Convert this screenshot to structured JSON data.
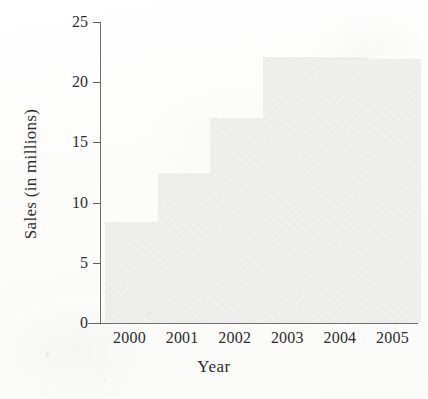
{
  "figure": {
    "background_color": "#fdfdfc",
    "axis_color": "#6f6f6f",
    "bar_color": "#efefee",
    "text_color": "#2c2c2c"
  },
  "chart_data": {
    "type": "bar",
    "title": "",
    "subtitle": "",
    "xlabel": "Year",
    "ylabel": "Sales (in millions)",
    "categories": [
      "2000",
      "2001",
      "2002",
      "2003",
      "2004",
      "2005"
    ],
    "values": [
      8.4,
      12.5,
      17.0,
      22.1,
      22.1,
      21.9
    ],
    "ylim": [
      0,
      25
    ],
    "ytick_labels": [
      "0",
      "5",
      "10",
      "15",
      "20",
      "25"
    ],
    "ytick_values": [
      0,
      5,
      10,
      15,
      20,
      25
    ],
    "grid": false,
    "legend": null,
    "annotations": []
  }
}
